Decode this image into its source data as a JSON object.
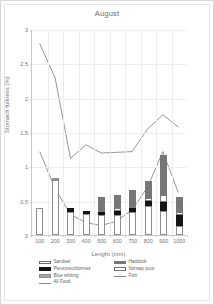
{
  "chart_data": {
    "type": "bar",
    "title": "August",
    "xlabel": "Lenght (mm)",
    "ylabel": "Stomach fullness (%)",
    "categories": [
      "100",
      "200",
      "300",
      "400",
      "500",
      "600",
      "700",
      "800",
      "900",
      "1000"
    ],
    "ylim": [
      0,
      3
    ],
    "yticks": [
      "0",
      "0.5",
      "1",
      "1.5",
      "2",
      "2.5",
      "3"
    ],
    "ytick_values": [
      0,
      0.5,
      1,
      1.5,
      2,
      2.5,
      3
    ],
    "grid": true,
    "legend_position": "bottom",
    "stacked": true,
    "series": [
      {
        "name": "Sandeel",
        "key": "sandeel",
        "color": "#ffffff",
        "values": [
          0.4,
          0.8,
          0.34,
          0.3,
          0.29,
          0.29,
          0.33,
          0.42,
          0.35,
          0.13
        ]
      },
      {
        "name": "Pleuronectiformes",
        "key": "pleuro",
        "color": "#141414",
        "values": [
          0.0,
          0.0,
          0.06,
          0.05,
          0.04,
          0.06,
          0.06,
          0.07,
          0.13,
          0.16
        ]
      },
      {
        "name": "Blue whiting",
        "key": "bluewhiting",
        "color": "#a8a8a8",
        "values": [
          0.0,
          0.02,
          0.0,
          0.0,
          0.0,
          0.0,
          0.0,
          0.0,
          0.0,
          0.0
        ]
      },
      {
        "name": "Norway pout",
        "key": "norwaypout",
        "color": "#fdfdfd",
        "values": [
          0.0,
          0.0,
          0.0,
          0.0,
          0.03,
          0.04,
          0.04,
          0.05,
          0.1,
          0.05
        ]
      },
      {
        "name": "Haddock",
        "key": "haddock",
        "color": "#767676",
        "values": [
          0.0,
          0.0,
          0.0,
          0.0,
          0.19,
          0.19,
          0.22,
          0.25,
          0.58,
          0.21
        ]
      }
    ],
    "lines": [
      {
        "name": "Fish",
        "key": "fish",
        "color": "#8a8a8d",
        "values": [
          1.22,
          0.68,
          0.3,
          0.18,
          0.14,
          0.2,
          0.37,
          0.7,
          1.22,
          0.62
        ]
      },
      {
        "name": "All Food",
        "key": "allfood",
        "color": "#8a8a8d",
        "values": [
          2.8,
          2.3,
          1.12,
          1.32,
          1.2,
          1.21,
          1.22,
          1.55,
          1.76,
          1.58
        ]
      }
    ]
  },
  "legend": {
    "rows": [
      {
        "left": {
          "label": "Sandeel",
          "swatch": "sandeel"
        },
        "right": {
          "label": "Haddock",
          "swatch": "haddock"
        }
      },
      {
        "left": {
          "label": "Pleuronectiformes",
          "swatch": "pleuro"
        },
        "right": {
          "label": "Norway pout",
          "swatch": "norwaypout"
        }
      },
      {
        "left": {
          "label": "Blue whiting",
          "swatch": "bluewhiting"
        },
        "right": {
          "label": "Fish",
          "swatch": "line"
        }
      },
      {
        "left": {
          "label": "All Food",
          "swatch": "line"
        },
        "right": {
          "label": "",
          "swatch": "none"
        }
      }
    ]
  }
}
